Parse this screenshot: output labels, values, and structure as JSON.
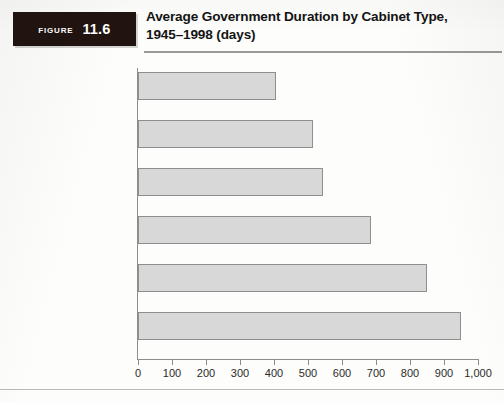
{
  "figure": {
    "badge_word": "Figure",
    "badge_number": "11.6",
    "title_line1": "Average Government Duration by Cabinet Type,",
    "title_line2": "1945–1998 (days)"
  },
  "chart_data": {
    "type": "bar",
    "orientation": "horizontal",
    "title": "Average Government Duration by Cabinet Type, 1945–1998 (days)",
    "xlabel": "",
    "ylabel": "",
    "xlim": [
      0,
      1000
    ],
    "grid": false,
    "legend": null,
    "categories": [
      "Minority coalition",
      "Surplus majority coalition",
      "Single-party minority",
      "All cabinets",
      "Minimal winning coalition",
      "Single-party majority"
    ],
    "values": [
      405,
      515,
      545,
      685,
      850,
      950
    ],
    "tick_values": [
      0,
      100,
      200,
      300,
      400,
      500,
      600,
      700,
      800,
      900,
      1000
    ],
    "tick_labels": [
      "0",
      "100",
      "200",
      "300",
      "400",
      "500",
      "600",
      "700",
      "800",
      "900",
      "1,000"
    ],
    "bar_fill": "#d8d8d8",
    "bar_stroke": "#8f8f8f"
  },
  "category_label_lines": [
    [
      "Minority coalition"
    ],
    [
      "Surplus majority",
      "coalition"
    ],
    [
      "Single-party minority"
    ],
    [
      "All cabinets"
    ],
    [
      "Minimal winning",
      "coalition"
    ],
    [
      "Single-party majority"
    ]
  ]
}
